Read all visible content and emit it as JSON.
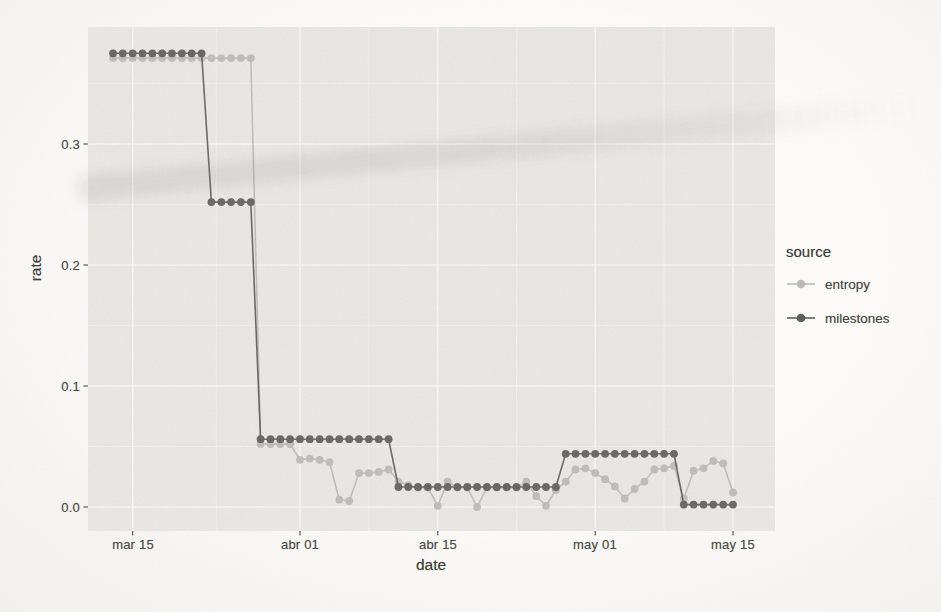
{
  "colors": {
    "page_bg": "#faf9f7",
    "panel_bg": "#e9e8e5",
    "grid_major": "#f8f7f5",
    "grid_minor": "#f2f1ee",
    "tick_mark": "#4a4946",
    "axis_text": "#4b4a47",
    "title_text": "#3d3c39",
    "entropy": "#bcbab6",
    "milestones": "#5e5d5a"
  },
  "chart_data": {
    "type": "line",
    "title": "",
    "xlabel": "date",
    "ylabel": "rate",
    "legend_title": "source",
    "legend_position": "right",
    "grid": true,
    "marker": "circle",
    "x": [
      "mar 13",
      "mar 14",
      "mar 15",
      "mar 16",
      "mar 17",
      "mar 18",
      "mar 19",
      "mar 20",
      "mar 21",
      "mar 22",
      "mar 23",
      "mar 24",
      "mar 25",
      "mar 26",
      "mar 27",
      "mar 28",
      "mar 29",
      "mar 30",
      "mar 31",
      "abr 01",
      "abr 02",
      "abr 03",
      "abr 04",
      "abr 05",
      "abr 06",
      "abr 07",
      "abr 08",
      "abr 09",
      "abr 10",
      "abr 11",
      "abr 12",
      "abr 13",
      "abr 14",
      "abr 15",
      "abr 16",
      "abr 17",
      "abr 18",
      "abr 19",
      "abr 20",
      "abr 21",
      "abr 22",
      "abr 23",
      "abr 24",
      "abr 25",
      "abr 26",
      "abr 27",
      "abr 28",
      "abr 29",
      "abr 30",
      "may 01",
      "may 02",
      "may 03",
      "may 04",
      "may 05",
      "may 06",
      "may 07",
      "may 08",
      "may 09",
      "may 10",
      "may 11",
      "may 12",
      "may 13",
      "may 14",
      "may 15"
    ],
    "x_tick_labels": [
      "mar 15",
      "abr 01",
      "abr 15",
      "may 01",
      "may 15"
    ],
    "x_major_tick_indices": [
      2,
      19,
      33,
      49,
      63
    ],
    "x_minor_tick_indices": [
      10.5,
      26,
      41,
      56
    ],
    "y_tick_labels": [
      "0.0",
      "0.1",
      "0.2",
      "0.3"
    ],
    "y_major_ticks": [
      0.0,
      0.1,
      0.2,
      0.3
    ],
    "y_minor_ticks": [
      0.05,
      0.15,
      0.25,
      0.35
    ],
    "ylim": [
      -0.02,
      0.397
    ],
    "series": [
      {
        "name": "entropy",
        "color": "#bcbab6",
        "values": [
          0.371,
          0.371,
          0.371,
          0.371,
          0.371,
          0.371,
          0.371,
          0.371,
          0.371,
          0.371,
          0.371,
          0.371,
          0.371,
          0.371,
          0.371,
          0.052,
          0.052,
          0.052,
          0.052,
          0.039,
          0.04,
          0.039,
          0.037,
          0.006,
          0.005,
          0.028,
          0.028,
          0.029,
          0.031,
          0.021,
          0.018,
          0.016,
          0.016,
          0.001,
          0.021,
          0.016,
          0.016,
          0.0,
          0.016,
          0.016,
          0.016,
          0.016,
          0.021,
          0.009,
          0.001,
          0.014,
          0.021,
          0.031,
          0.032,
          0.028,
          0.023,
          0.017,
          0.007,
          0.015,
          0.021,
          0.031,
          0.032,
          0.034,
          0.007,
          0.03,
          0.032,
          0.038,
          0.036,
          0.012
        ]
      },
      {
        "name": "milestones",
        "color": "#5e5d5a",
        "values": [
          0.375,
          0.375,
          0.375,
          0.375,
          0.375,
          0.375,
          0.375,
          0.375,
          0.375,
          0.375,
          0.252,
          0.252,
          0.252,
          0.252,
          0.252,
          0.056,
          0.056,
          0.056,
          0.056,
          0.056,
          0.056,
          0.056,
          0.056,
          0.056,
          0.056,
          0.056,
          0.056,
          0.056,
          0.056,
          0.0165,
          0.0165,
          0.0165,
          0.0165,
          0.0165,
          0.0165,
          0.0165,
          0.0165,
          0.0165,
          0.0165,
          0.0165,
          0.0165,
          0.0165,
          0.0165,
          0.0165,
          0.0165,
          0.0165,
          0.044,
          0.044,
          0.044,
          0.044,
          0.044,
          0.044,
          0.044,
          0.044,
          0.044,
          0.044,
          0.044,
          0.044,
          0.002,
          0.002,
          0.002,
          0.002,
          0.002,
          0.002
        ]
      }
    ]
  }
}
